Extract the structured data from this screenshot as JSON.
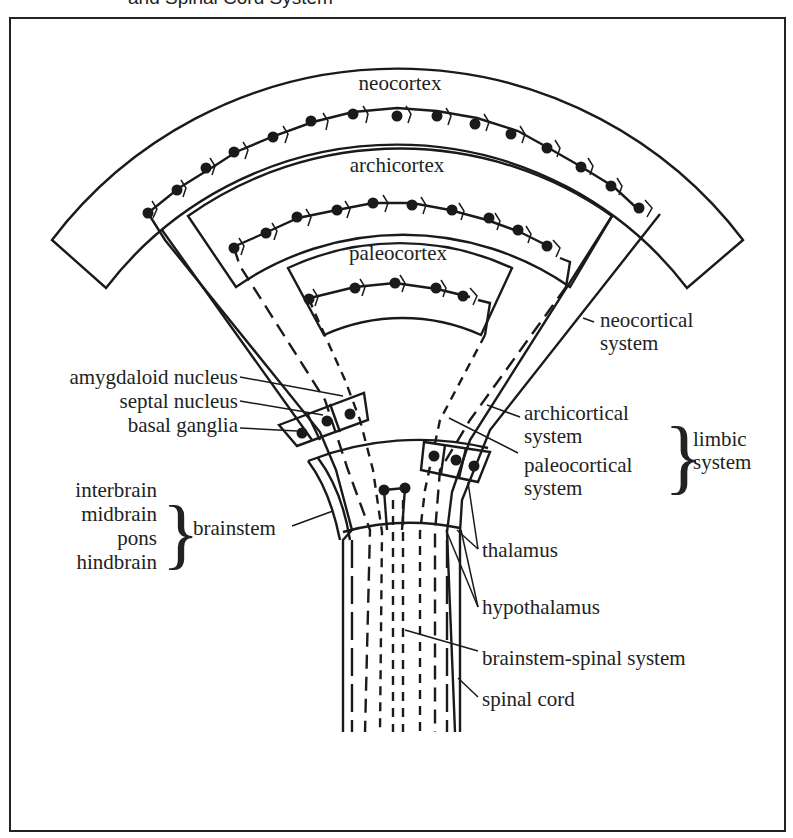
{
  "figure": {
    "caption_partial": "and Spinal Cord System"
  },
  "regions": {
    "neocortex": "neocortex",
    "archicortex": "archicortex",
    "paleocortex": "paleocortex"
  },
  "left_labels": {
    "amygdaloid": "amygdaloid nucleus",
    "septal": "septal nucleus",
    "basal": "basal ganglia",
    "interbrain": "interbrain",
    "midbrain": "midbrain",
    "pons": "pons",
    "hindbrain": "hindbrain",
    "brainstem": "brainstem"
  },
  "right_labels": {
    "neocortical_1": "neocortical",
    "neocortical_2": "system",
    "archicortical_1": "archicortical",
    "archicortical_2": "system",
    "paleocortical_1": "paleocortical",
    "paleocortical_2": "system",
    "limbic_1": "limbic",
    "limbic_2": "system",
    "thalamus": "thalamus",
    "hypothalamus": "hypothalamus",
    "brainstem_spinal": "brainstem-spinal system",
    "spinal_cord": "spinal cord"
  },
  "glyphs": {
    "brace": "}"
  }
}
